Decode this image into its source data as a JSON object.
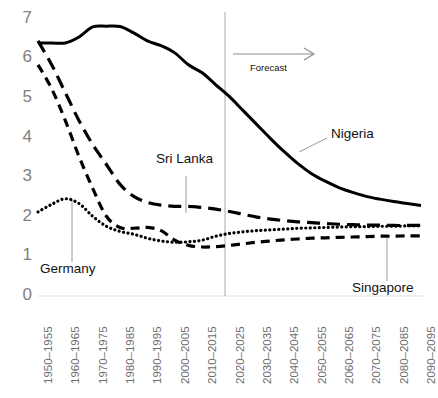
{
  "chart_data": {
    "type": "line",
    "title": "",
    "xlabel": "",
    "ylabel": "",
    "ylim": [
      0,
      7
    ],
    "yticks": [
      0,
      1,
      2,
      3,
      4,
      5,
      6,
      7
    ],
    "grid": false,
    "legend_position": "inline-annotations",
    "categories": [
      "1950–1955",
      "1955–1960",
      "1960–1965",
      "1965–1970",
      "1970–1975",
      "1975–1980",
      "1980–1985",
      "1985–1990",
      "1990–1995",
      "1995–2000",
      "2000–2005",
      "2005–2010",
      "2010–2015",
      "2015–2020",
      "2020–2025",
      "2025–2030",
      "2030–2035",
      "2035–2040",
      "2040–2045",
      "2045–2050",
      "2050–2055",
      "2055–2060",
      "2060–2065",
      "2065–2070",
      "2070–2075",
      "2075–2080",
      "2080–2085",
      "2085–2090",
      "2090–2095"
    ],
    "visible_tick_labels": [
      "1950–1955",
      "1960–1965",
      "1970–1975",
      "1980–1985",
      "1990–1995",
      "2000–2005",
      "2010–2015",
      "2020–2025",
      "2030–2035",
      "2040–2045",
      "2050–2055",
      "2060–2065",
      "2070–2075",
      "2080–2085",
      "2090–2095"
    ],
    "series": [
      {
        "name": "Nigeria",
        "style": "solid",
        "values": [
          6.35,
          6.35,
          6.35,
          6.5,
          6.75,
          6.77,
          6.76,
          6.6,
          6.4,
          6.28,
          6.1,
          5.8,
          5.6,
          5.3,
          5.0,
          4.65,
          4.3,
          3.95,
          3.62,
          3.32,
          3.07,
          2.88,
          2.72,
          2.6,
          2.5,
          2.43,
          2.37,
          2.32,
          2.27
        ]
      },
      {
        "name": "Sri Lanka",
        "style": "long-dash",
        "values": [
          6.4,
          5.8,
          5.1,
          4.4,
          3.8,
          3.3,
          2.8,
          2.5,
          2.35,
          2.28,
          2.25,
          2.25,
          2.22,
          2.18,
          2.12,
          2.05,
          1.98,
          1.93,
          1.89,
          1.86,
          1.84,
          1.82,
          1.8,
          1.79,
          1.78,
          1.78,
          1.77,
          1.77,
          1.77
        ]
      },
      {
        "name": "Germany",
        "style": "dotted",
        "values": [
          2.11,
          2.3,
          2.44,
          2.32,
          2.0,
          1.75,
          1.62,
          1.55,
          1.45,
          1.38,
          1.35,
          1.36,
          1.4,
          1.5,
          1.57,
          1.61,
          1.64,
          1.66,
          1.68,
          1.7,
          1.71,
          1.72,
          1.73,
          1.74,
          1.74,
          1.75,
          1.75,
          1.76,
          1.76
        ]
      },
      {
        "name": "Singapore",
        "style": "medium-dash",
        "values": [
          5.8,
          5.2,
          4.4,
          3.5,
          2.7,
          2.0,
          1.72,
          1.7,
          1.72,
          1.64,
          1.4,
          1.27,
          1.23,
          1.24,
          1.27,
          1.31,
          1.35,
          1.38,
          1.41,
          1.43,
          1.45,
          1.46,
          1.47,
          1.48,
          1.49,
          1.5,
          1.5,
          1.51,
          1.51
        ]
      }
    ],
    "annotations": [
      {
        "name": "Nigeria",
        "label": "Nigeria"
      },
      {
        "name": "Sri Lanka",
        "label": "Sri Lanka"
      },
      {
        "name": "Germany",
        "label": "Germany"
      },
      {
        "name": "Singapore",
        "label": "Singapore"
      }
    ],
    "forecast": {
      "label": "Forecast",
      "divider_category": "2020–2025",
      "arrow": "right-arrow"
    },
    "colors": {
      "series_line": "#000000",
      "axis_label": "#808080",
      "tick_label": "#6d6d6d",
      "baseline": "#e8e8e8",
      "forecast_divider": "#bdbdbd",
      "forecast_arrow": "#8c8c8c",
      "leader_line": "#9a9a9a",
      "background": "#ffffff"
    }
  }
}
